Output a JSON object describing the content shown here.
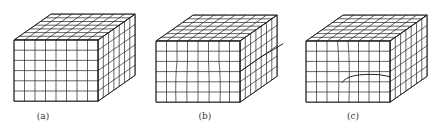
{
  "figure": {
    "panels": [
      {
        "id": "a",
        "label": "(a)",
        "type": "perfect-crystal",
        "origin": [
          14,
          40
        ],
        "label_x": 23
      },
      {
        "id": "b",
        "label": "(b)",
        "type": "edge-dislocation-step",
        "origin": [
          156,
          41
        ],
        "label_x": 185
      },
      {
        "id": "c",
        "label": "(c)",
        "type": "screw-dislocation-partial",
        "origin": [
          306,
          41
        ],
        "label_x": 333
      }
    ],
    "grid": {
      "cols": 8,
      "rows": 6,
      "depth": 7,
      "cell_w": 10.5,
      "cell_h": 10.2,
      "dx": 5.3,
      "dy": -3.7
    },
    "line_color": "#222222",
    "caption": ""
  }
}
